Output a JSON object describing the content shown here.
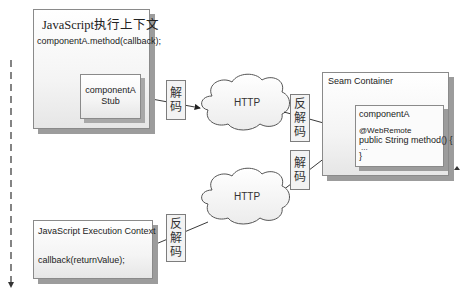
{
  "diagram": {
    "js_context_top": {
      "title": "JavaScript执行上下文",
      "call": "componentA.method(callback);",
      "stub_line1": "componentA",
      "stub_line2": "Stub"
    },
    "seam_container": {
      "title": "Seam Container",
      "component_name": "componentA",
      "annotation": "@WebRemote",
      "method_sig": "public String method() {",
      "ellipsis": "...",
      "close_brace": "}"
    },
    "js_context_bottom": {
      "title": "JavaScript Execution Context",
      "callback": "callback(returnValue);"
    },
    "clouds": {
      "upper": "HTTP",
      "lower": "HTTP"
    },
    "labels": {
      "encode_1": [
        "解",
        "码"
      ],
      "decode_1": [
        "反",
        "解",
        "码"
      ],
      "encode_2": [
        "解",
        "码"
      ],
      "decode_2": [
        "反",
        "解",
        "码"
      ]
    }
  }
}
